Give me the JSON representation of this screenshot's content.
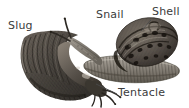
{
  "figure": {
    "background_color": "#ffffff",
    "label_color": "#3b3b3b",
    "width": 189,
    "height": 108
  },
  "labels": {
    "slug": "Slug",
    "snail": "Snail",
    "shell": "Shell",
    "tentacle": "Tentacle"
  },
  "leader_lines": [
    {
      "name": "shell-leader-line",
      "from_x": 151,
      "from_y": 20,
      "to_x": 141,
      "to_y": 31
    },
    {
      "name": "tentacle-leader-line",
      "from_x": 96,
      "from_y": 84,
      "to_x": 117,
      "to_y": 94
    }
  ],
  "organisms": [
    {
      "name": "slug",
      "description": "dark crescent-shaped slug with ridged mantle, body arcing from upper-left down to lower-right, head and tentacles at lower right",
      "body_color": "#4a4540",
      "mantle_color": "#6b635a",
      "tentacles": 4
    },
    {
      "name": "snail",
      "description": "snail with banded coiled shell at right, elongated grey foot extending to the right, head and two long tentacles pointing upper-left",
      "shell_color": "#5f5850",
      "shell_band_color": "#2e2a26",
      "foot_color": "#8d8880",
      "tentacles": 2
    }
  ]
}
